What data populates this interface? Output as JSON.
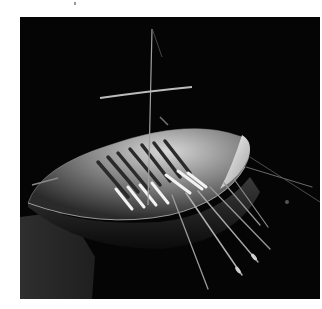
{
  "image": {
    "subject": "Gold model boat with mast, yard and oars on black background",
    "alt": "Photograph of a small gold boat model with a mast, a crossbar yard, rowing benches and oars, lit against a black background"
  },
  "colors": {
    "page_background": "#ffffff",
    "photo_background": "#050505",
    "shadow_region": "#2a2a2a",
    "hull_highlight": "#e8e8e8",
    "hull_mid": "#8a8a8a",
    "hull_dark": "#3a3a3a"
  }
}
